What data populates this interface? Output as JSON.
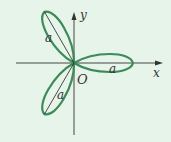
{
  "diagram": {
    "type": "three-leaf rose (polar curve)",
    "colors": {
      "background": "#e6f4ea",
      "curve": "#3d8a5a",
      "axis": "#333333",
      "radius_line": "#222222"
    },
    "origin_label": "O",
    "x_axis_label": "x",
    "y_axis_label": "y",
    "petal_length_label": "a",
    "petals": [
      {
        "direction_deg": 0,
        "label": "a"
      },
      {
        "direction_deg": 120,
        "label": "a"
      },
      {
        "direction_deg": 240,
        "label": "a"
      }
    ]
  }
}
